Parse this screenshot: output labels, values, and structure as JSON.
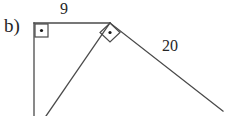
{
  "figure": {
    "part_label": "b)",
    "labels": {
      "top_side": "9",
      "right_side": "20"
    },
    "colors": {
      "background": "#ffffff",
      "stroke": "#4a4a4a",
      "text": "#262626",
      "marker_dot": "#1a1a1a"
    },
    "geometry": {
      "description": "right triangle with vertical leg, horizontal top leg of length 9, and a second right triangle sharing the apex with hypotenuse-side of length 20",
      "points": {
        "top_left_corner": [
          34,
          23
        ],
        "apex": [
          110,
          23
        ],
        "vertical_leg_bottom": [
          34,
          116
        ],
        "left_diagonal_bottom": [
          46,
          116
        ],
        "right_diagonal_end": [
          223,
          111
        ]
      },
      "right_angle_markers": [
        {
          "name": "top-left-right-angle",
          "type": "square",
          "vertices": [
            [
              35,
              24
            ],
            [
              48,
              24
            ],
            [
              48,
              37
            ],
            [
              35,
              37
            ]
          ],
          "dot": [
            41.5,
            30.5
          ]
        },
        {
          "name": "apex-right-angle",
          "type": "diamond",
          "vertices": [
            [
              110,
              23
            ],
            [
              120,
              32
            ],
            [
              110,
              42
            ],
            [
              100,
              32
            ]
          ],
          "dot": [
            110,
            32.5
          ]
        }
      ]
    }
  }
}
